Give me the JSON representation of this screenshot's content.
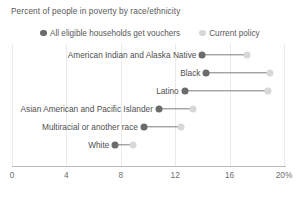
{
  "chart_data": {
    "type": "scatter",
    "subtype": "dumbbell",
    "title": "Percent of people in poverty by race/ethnicity",
    "xlabel": "",
    "ylabel": "",
    "xlim": [
      0,
      21.5
    ],
    "grid": true,
    "legend_position": "top",
    "xticks": [
      {
        "value": 0,
        "label": "0"
      },
      {
        "value": 4,
        "label": "4"
      },
      {
        "value": 8,
        "label": "8"
      },
      {
        "value": 12,
        "label": "12"
      },
      {
        "value": 16,
        "label": "16"
      },
      {
        "value": 20,
        "label": "20%"
      }
    ],
    "categories": [
      "American Indian and Alaska Native",
      "Black",
      "Latino",
      "Asian American and Pacific Islander",
      "Multiracial or another race",
      "White"
    ],
    "series": [
      {
        "name": "All eligible households get vouchers",
        "color": "#6b6b6b",
        "values": [
          14.0,
          14.3,
          12.7,
          10.8,
          9.7,
          7.6
        ]
      },
      {
        "name": "Current policy",
        "color": "#d8d8d8",
        "values": [
          17.3,
          19.0,
          18.8,
          13.3,
          12.4,
          8.9
        ]
      }
    ]
  },
  "legend": {
    "items": [
      {
        "label": "All eligible households get vouchers",
        "swatch": "legend-dot-dark"
      },
      {
        "label": "Current policy",
        "swatch": "legend-dot-light"
      }
    ]
  },
  "colors": {
    "series_dark": "#6b6b6b",
    "series_light": "#d8d8d8",
    "connector": "#7d7d7d",
    "grid": "#ebebeb",
    "axis": "#b9b9b9",
    "text": "#4f4f4f"
  }
}
